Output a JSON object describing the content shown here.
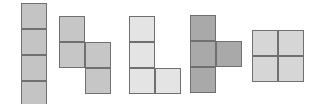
{
  "pieces": [
    {
      "name": "I-tetromino",
      "color": "#c4c4c4",
      "cells": [
        [
          0,
          0
        ],
        [
          0,
          1
        ],
        [
          0,
          2
        ],
        [
          0,
          3
        ]
      ]
    },
    {
      "name": "S-tetromino",
      "color": "#c6c6c6",
      "cells": [
        [
          0,
          0
        ],
        [
          0,
          1
        ],
        [
          1,
          1
        ],
        [
          1,
          2
        ]
      ]
    },
    {
      "name": "L-tetromino",
      "color": "#e4e4e4",
      "cells": [
        [
          0,
          0
        ],
        [
          0,
          1
        ],
        [
          0,
          2
        ],
        [
          1,
          2
        ]
      ]
    },
    {
      "name": "T-tetromino",
      "color": "#a9a9a9",
      "cells": [
        [
          0,
          0
        ],
        [
          0,
          1
        ],
        [
          1,
          1
        ],
        [
          0,
          2
        ]
      ]
    },
    {
      "name": "O-tetromino",
      "color": "#d6d6d6",
      "cells": [
        [
          0,
          0
        ],
        [
          1,
          0
        ],
        [
          0,
          1
        ],
        [
          1,
          1
        ]
      ]
    }
  ]
}
